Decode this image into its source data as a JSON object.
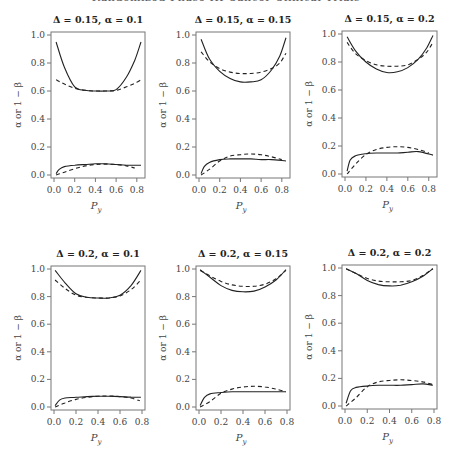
{
  "header": {
    "text": "Randomized Phase III Cancer Clinical Trials"
  },
  "chart_data": [
    {
      "type": "line",
      "title": "Δ = 0.15, α = 0.1",
      "xlabel": "P_y",
      "ylabel": "α or 1 − β",
      "xlim": [
        0,
        0.85
      ],
      "ylim": [
        0,
        1.0
      ],
      "xticks": [
        0.0,
        0.2,
        0.4,
        0.6,
        0.8
      ],
      "yticks": [
        0.0,
        0.2,
        0.4,
        0.6,
        0.8,
        1.0
      ],
      "grid": false,
      "series": [
        {
          "name": "power (solid)",
          "style": "solid",
          "x": [
            0.02,
            0.1,
            0.2,
            0.3,
            0.4,
            0.5,
            0.6,
            0.7,
            0.78,
            0.84
          ],
          "y": [
            0.95,
            0.77,
            0.63,
            0.605,
            0.6,
            0.6,
            0.61,
            0.7,
            0.82,
            0.95
          ]
        },
        {
          "name": "power (dashed)",
          "style": "dashed",
          "x": [
            0.02,
            0.1,
            0.2,
            0.3,
            0.4,
            0.5,
            0.6,
            0.7,
            0.78,
            0.84
          ],
          "y": [
            0.68,
            0.65,
            0.62,
            0.605,
            0.6,
            0.6,
            0.605,
            0.63,
            0.655,
            0.68
          ]
        },
        {
          "name": "alpha (solid)",
          "style": "solid",
          "x": [
            0.02,
            0.05,
            0.1,
            0.2,
            0.3,
            0.4,
            0.5,
            0.6,
            0.7,
            0.84
          ],
          "y": [
            0.01,
            0.04,
            0.06,
            0.07,
            0.075,
            0.08,
            0.08,
            0.075,
            0.07,
            0.07
          ]
        },
        {
          "name": "alpha (dashed)",
          "style": "dashed",
          "x": [
            0.02,
            0.1,
            0.2,
            0.3,
            0.4,
            0.5,
            0.6,
            0.7,
            0.78
          ],
          "y": [
            0.0,
            0.02,
            0.045,
            0.065,
            0.075,
            0.078,
            0.075,
            0.065,
            0.05
          ]
        }
      ]
    },
    {
      "type": "line",
      "title": "Δ = 0.15, α = 0.15",
      "xlabel": "P_y",
      "ylabel": "α or 1 − β",
      "xlim": [
        0,
        0.85
      ],
      "ylim": [
        0,
        1.0
      ],
      "xticks": [
        0.0,
        0.2,
        0.4,
        0.6,
        0.8
      ],
      "yticks": [
        0.0,
        0.2,
        0.4,
        0.6,
        0.8,
        1.0
      ],
      "grid": false,
      "series": [
        {
          "name": "power (solid)",
          "style": "solid",
          "x": [
            0.02,
            0.1,
            0.2,
            0.3,
            0.4,
            0.5,
            0.6,
            0.7,
            0.78,
            0.84
          ],
          "y": [
            0.97,
            0.83,
            0.74,
            0.69,
            0.665,
            0.665,
            0.68,
            0.75,
            0.85,
            0.98
          ]
        },
        {
          "name": "power (dashed)",
          "style": "dashed",
          "x": [
            0.02,
            0.1,
            0.2,
            0.3,
            0.4,
            0.5,
            0.6,
            0.7,
            0.78,
            0.84
          ],
          "y": [
            0.88,
            0.81,
            0.76,
            0.735,
            0.725,
            0.725,
            0.735,
            0.76,
            0.8,
            0.87
          ]
        },
        {
          "name": "alpha (solid)",
          "style": "solid",
          "x": [
            0.02,
            0.05,
            0.1,
            0.2,
            0.3,
            0.4,
            0.5,
            0.6,
            0.7,
            0.84
          ],
          "y": [
            0.01,
            0.06,
            0.09,
            0.11,
            0.115,
            0.115,
            0.115,
            0.11,
            0.11,
            0.1
          ]
        },
        {
          "name": "alpha (dashed)",
          "style": "dashed",
          "x": [
            0.02,
            0.1,
            0.2,
            0.3,
            0.4,
            0.5,
            0.6,
            0.7,
            0.8
          ],
          "y": [
            0.0,
            0.04,
            0.1,
            0.135,
            0.145,
            0.15,
            0.145,
            0.13,
            0.11
          ]
        }
      ]
    },
    {
      "type": "line",
      "title": "Δ = 0.15, α = 0.2",
      "xlabel": "P_y",
      "ylabel": "α or 1 − β",
      "xlim": [
        0,
        0.85
      ],
      "ylim": [
        0,
        1.0
      ],
      "xticks": [
        0.0,
        0.2,
        0.4,
        0.6,
        0.8
      ],
      "yticks": [
        0.0,
        0.2,
        0.4,
        0.6,
        0.8,
        1.0
      ],
      "grid": false,
      "series": [
        {
          "name": "power (solid)",
          "style": "solid",
          "x": [
            0.02,
            0.1,
            0.2,
            0.3,
            0.4,
            0.5,
            0.6,
            0.7,
            0.78,
            0.84
          ],
          "y": [
            0.98,
            0.88,
            0.8,
            0.75,
            0.725,
            0.73,
            0.76,
            0.82,
            0.9,
            0.99
          ]
        },
        {
          "name": "power (dashed)",
          "style": "dashed",
          "x": [
            0.02,
            0.1,
            0.2,
            0.3,
            0.4,
            0.5,
            0.6,
            0.7,
            0.78,
            0.84
          ],
          "y": [
            0.94,
            0.86,
            0.81,
            0.78,
            0.77,
            0.77,
            0.78,
            0.82,
            0.87,
            0.94
          ]
        },
        {
          "name": "alpha (solid)",
          "style": "solid",
          "x": [
            0.02,
            0.05,
            0.1,
            0.2,
            0.3,
            0.4,
            0.5,
            0.6,
            0.7,
            0.84
          ],
          "y": [
            0.02,
            0.1,
            0.13,
            0.145,
            0.15,
            0.15,
            0.15,
            0.155,
            0.16,
            0.135
          ]
        },
        {
          "name": "alpha (dashed)",
          "style": "dashed",
          "x": [
            0.02,
            0.1,
            0.2,
            0.3,
            0.4,
            0.5,
            0.6,
            0.7,
            0.8
          ],
          "y": [
            0.0,
            0.07,
            0.14,
            0.175,
            0.19,
            0.195,
            0.19,
            0.175,
            0.15
          ]
        }
      ]
    },
    {
      "type": "line",
      "title": "Δ = 0.2, α = 0.1",
      "xlabel": "P_y",
      "ylabel": "α or 1 − β",
      "xlim": [
        0,
        0.8
      ],
      "ylim": [
        0,
        1.0
      ],
      "xticks": [
        0.0,
        0.2,
        0.4,
        0.6,
        0.8
      ],
      "yticks": [
        0.0,
        0.2,
        0.4,
        0.6,
        0.8,
        1.0
      ],
      "grid": false,
      "series": [
        {
          "name": "power (solid)",
          "style": "solid",
          "x": [
            0.01,
            0.1,
            0.2,
            0.3,
            0.4,
            0.5,
            0.6,
            0.7,
            0.79
          ],
          "y": [
            0.99,
            0.9,
            0.82,
            0.795,
            0.79,
            0.79,
            0.81,
            0.88,
            0.99
          ]
        },
        {
          "name": "power (dashed)",
          "style": "dashed",
          "x": [
            0.01,
            0.1,
            0.2,
            0.3,
            0.4,
            0.5,
            0.6,
            0.7,
            0.79
          ],
          "y": [
            0.92,
            0.86,
            0.81,
            0.795,
            0.79,
            0.79,
            0.805,
            0.85,
            0.92
          ]
        },
        {
          "name": "alpha (solid)",
          "style": "solid",
          "x": [
            0.01,
            0.05,
            0.1,
            0.2,
            0.3,
            0.4,
            0.5,
            0.6,
            0.7,
            0.79
          ],
          "y": [
            0.01,
            0.05,
            0.065,
            0.07,
            0.075,
            0.078,
            0.078,
            0.075,
            0.072,
            0.07
          ]
        },
        {
          "name": "alpha (dashed)",
          "style": "dashed",
          "x": [
            0.01,
            0.1,
            0.2,
            0.3,
            0.4,
            0.5,
            0.6,
            0.7,
            0.78
          ],
          "y": [
            0.0,
            0.03,
            0.055,
            0.07,
            0.078,
            0.08,
            0.075,
            0.065,
            0.045
          ]
        }
      ]
    },
    {
      "type": "line",
      "title": "Δ = 0.2, α = 0.15",
      "xlabel": "P_y",
      "ylabel": "α or 1 − β",
      "xlim": [
        0,
        0.8
      ],
      "ylim": [
        0,
        1.0
      ],
      "xticks": [
        0.0,
        0.2,
        0.4,
        0.6,
        0.8
      ],
      "yticks": [
        0.0,
        0.2,
        0.4,
        0.6,
        0.8,
        1.0
      ],
      "grid": false,
      "series": [
        {
          "name": "power (solid)",
          "style": "solid",
          "x": [
            0.01,
            0.1,
            0.2,
            0.3,
            0.4,
            0.5,
            0.6,
            0.7,
            0.79
          ],
          "y": [
            0.995,
            0.94,
            0.88,
            0.845,
            0.835,
            0.84,
            0.87,
            0.92,
            0.995
          ]
        },
        {
          "name": "power (dashed)",
          "style": "dashed",
          "x": [
            0.01,
            0.1,
            0.2,
            0.3,
            0.4,
            0.5,
            0.6,
            0.7,
            0.79
          ],
          "y": [
            0.99,
            0.95,
            0.91,
            0.885,
            0.875,
            0.875,
            0.89,
            0.93,
            0.99
          ]
        },
        {
          "name": "alpha (solid)",
          "style": "solid",
          "x": [
            0.01,
            0.05,
            0.1,
            0.2,
            0.3,
            0.4,
            0.5,
            0.6,
            0.7,
            0.79
          ],
          "y": [
            0.01,
            0.07,
            0.095,
            0.105,
            0.11,
            0.11,
            0.11,
            0.11,
            0.11,
            0.11
          ]
        },
        {
          "name": "alpha (dashed)",
          "style": "dashed",
          "x": [
            0.01,
            0.1,
            0.2,
            0.3,
            0.4,
            0.5,
            0.6,
            0.7,
            0.79
          ],
          "y": [
            0.0,
            0.04,
            0.1,
            0.13,
            0.145,
            0.15,
            0.145,
            0.13,
            0.11
          ]
        }
      ]
    },
    {
      "type": "line",
      "title": "Δ = 0.2, α = 0.2",
      "xlabel": "P_y",
      "ylabel": "α or 1 − β",
      "xlim": [
        0,
        0.8
      ],
      "ylim": [
        0,
        1.0
      ],
      "xticks": [
        0.0,
        0.2,
        0.4,
        0.6,
        0.8
      ],
      "yticks": [
        0.0,
        0.2,
        0.4,
        0.6,
        0.8,
        1.0
      ],
      "grid": false,
      "series": [
        {
          "name": "power (solid)",
          "style": "solid",
          "x": [
            0.01,
            0.1,
            0.2,
            0.3,
            0.4,
            0.5,
            0.6,
            0.7,
            0.79
          ],
          "y": [
            0.995,
            0.96,
            0.91,
            0.88,
            0.87,
            0.875,
            0.9,
            0.94,
            0.995
          ]
        },
        {
          "name": "power (dashed)",
          "style": "dashed",
          "x": [
            0.01,
            0.1,
            0.2,
            0.3,
            0.4,
            0.5,
            0.6,
            0.7,
            0.79
          ],
          "y": [
            0.995,
            0.96,
            0.925,
            0.905,
            0.9,
            0.9,
            0.91,
            0.945,
            0.995
          ]
        },
        {
          "name": "alpha (solid)",
          "style": "solid",
          "x": [
            0.01,
            0.05,
            0.1,
            0.2,
            0.3,
            0.4,
            0.5,
            0.6,
            0.7,
            0.79
          ],
          "y": [
            0.02,
            0.11,
            0.135,
            0.145,
            0.15,
            0.15,
            0.15,
            0.155,
            0.16,
            0.15
          ]
        },
        {
          "name": "alpha (dashed)",
          "style": "dashed",
          "x": [
            0.01,
            0.1,
            0.2,
            0.3,
            0.4,
            0.5,
            0.6,
            0.7,
            0.79
          ],
          "y": [
            0.0,
            0.06,
            0.14,
            0.175,
            0.185,
            0.19,
            0.185,
            0.175,
            0.155
          ]
        }
      ]
    }
  ],
  "layout": {
    "panels": [
      {
        "x0": 51,
        "y0": 32,
        "x1": 145,
        "y1": 178
      },
      {
        "x0": 196,
        "y0": 32,
        "x1": 290,
        "y1": 178
      },
      {
        "x0": 342,
        "y0": 31,
        "x1": 437,
        "y1": 177
      },
      {
        "x0": 51,
        "y0": 266,
        "x1": 145,
        "y1": 410
      },
      {
        "x0": 196,
        "y0": 266,
        "x1": 290,
        "y1": 410
      },
      {
        "x0": 342,
        "y0": 265,
        "x1": 437,
        "y1": 409
      }
    ],
    "line_color": "#222222",
    "frame_color": "#777777"
  }
}
